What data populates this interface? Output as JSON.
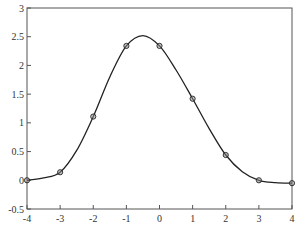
{
  "chart_data": {
    "type": "line",
    "title": "",
    "xlabel": "",
    "ylabel": "",
    "xlim": [
      -4,
      4
    ],
    "ylim": [
      -0.5,
      3
    ],
    "grid": false,
    "legend": null,
    "x_ticks": [
      "-4",
      "-3",
      "-2",
      "-1",
      "0",
      "1",
      "2",
      "3",
      "4"
    ],
    "y_ticks": [
      "-0.5",
      "0",
      "0.5",
      "1",
      "1.5",
      "2",
      "2.5",
      "3"
    ],
    "series": [
      {
        "name": "interpolating curve",
        "style": "solid line",
        "x": [
          -4,
          -3.5,
          -3,
          -2.5,
          -2,
          -1.5,
          -1,
          -0.5,
          0,
          0.5,
          1,
          1.5,
          2,
          2.5,
          3,
          3.5,
          4
        ],
        "values": [
          0,
          0.04,
          0.14,
          0.52,
          1.11,
          1.8,
          2.34,
          2.52,
          2.34,
          1.92,
          1.42,
          0.9,
          0.44,
          0.15,
          0.0,
          -0.04,
          -0.05
        ]
      },
      {
        "name": "data points",
        "style": "circle markers",
        "x": [
          -4,
          -3,
          -2,
          -1,
          0,
          1,
          2,
          3,
          4
        ],
        "values": [
          0,
          0.14,
          1.11,
          2.34,
          2.34,
          1.42,
          0.44,
          0.0,
          -0.05
        ]
      }
    ]
  },
  "colors": {
    "line": "#222222",
    "marker_fill": "#888888",
    "axes": "#444444"
  }
}
